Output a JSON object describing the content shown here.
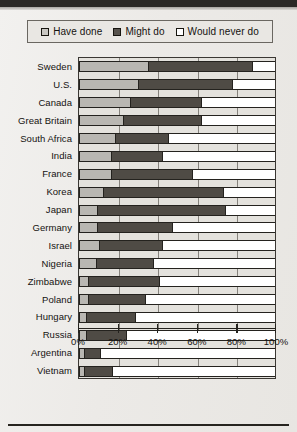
{
  "legend": {
    "items": [
      {
        "label": "Have done",
        "swatch": "legend-swatch-have-done",
        "color": "#c9c7c2"
      },
      {
        "label": "Might do",
        "swatch": "legend-swatch-might-do",
        "color": "#57534d"
      },
      {
        "label": "Would never do",
        "swatch": "legend-swatch-would-never-do",
        "color": "#ffffff"
      }
    ]
  },
  "axis": {
    "ticks": [
      "0%",
      "20%",
      "40%",
      "60%",
      "80%",
      "100%"
    ],
    "tick_values": [
      0,
      20,
      40,
      60,
      80,
      100
    ]
  },
  "chart_data": {
    "type": "bar",
    "orientation": "horizontal",
    "stacked": true,
    "title": "",
    "subtitle": "",
    "xlabel": "",
    "ylabel": "",
    "xlim": [
      0,
      100
    ],
    "ylim": null,
    "grid": true,
    "grid_axis": "x",
    "legend_position": "top",
    "categories": [
      "Sweden",
      "U.S.",
      "Canada",
      "Great Britain",
      "South Africa",
      "India",
      "France",
      "Korea",
      "Japan",
      "Germany",
      "Israel",
      "Nigeria",
      "Zimbabwe",
      "Poland",
      "Hungary",
      "Russia",
      "Argentina",
      "Vietnam"
    ],
    "series": [
      {
        "name": "Have done",
        "color": "#b9b7b2",
        "values": [
          35,
          30,
          26,
          22,
          18,
          16,
          16,
          12,
          9,
          9,
          10,
          8,
          4,
          4,
          3,
          3,
          2,
          2
        ]
      },
      {
        "name": "Might do",
        "color": "#4f4b45",
        "values": [
          53,
          48,
          36,
          40,
          27,
          26,
          41,
          61,
          65,
          38,
          32,
          29,
          36,
          29,
          25,
          20,
          8,
          14
        ]
      },
      {
        "name": "Would never do",
        "color": "#ffffff",
        "values": [
          12,
          22,
          38,
          38,
          55,
          58,
          43,
          27,
          26,
          53,
          58,
          63,
          60,
          67,
          72,
          77,
          90,
          84
        ]
      }
    ],
    "cumulative_boundaries": {
      "note": "end of 'Have done' and end of 'Might do' per category, in percent",
      "have_done_end": [
        35,
        30,
        26,
        22,
        18,
        16,
        16,
        12,
        9,
        9,
        10,
        8,
        4,
        4,
        3,
        3,
        2,
        2
      ],
      "might_do_end": [
        88,
        78,
        62,
        62,
        45,
        42,
        57,
        73,
        74,
        47,
        42,
        37,
        40,
        33,
        28,
        23,
        10,
        16
      ]
    }
  }
}
